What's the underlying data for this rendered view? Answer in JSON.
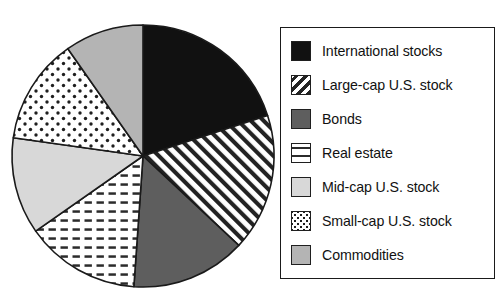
{
  "chart_data": {
    "type": "pie",
    "title": "",
    "subtitle": "",
    "xlabel": "",
    "ylabel": "",
    "legend_position": "right",
    "grid": false,
    "start_angle_deg": 0,
    "direction": "clockwise",
    "categories": [
      "International stocks",
      "Large-cap U.S. stock",
      "Bonds",
      "Real estate",
      "Mid-cap U.S. stock",
      "Small-cap U.S. stock",
      "Commodities"
    ],
    "values": [
      20,
      17,
      14,
      14,
      12,
      13,
      10
    ],
    "angles_deg": [
      72,
      61,
      51,
      51,
      43,
      47,
      35
    ],
    "slices": [
      {
        "label": "International stocks",
        "value": 20,
        "angle_deg": 72,
        "pattern": "solid-black",
        "color": "#111111"
      },
      {
        "label": "Large-cap U.S. stock",
        "value": 17,
        "angle_deg": 61,
        "pattern": "diagonal-hatch",
        "color": "#ffffff"
      },
      {
        "label": "Bonds",
        "value": 14,
        "angle_deg": 51,
        "pattern": "solid-dark-gray",
        "color": "#5e5e5e"
      },
      {
        "label": "Real estate",
        "value": 14,
        "angle_deg": 51,
        "pattern": "horizontal-dash",
        "color": "#ffffff"
      },
      {
        "label": "Mid-cap U.S. stock",
        "value": 12,
        "angle_deg": 43,
        "pattern": "solid-light-gray",
        "color": "#d8d8d8"
      },
      {
        "label": "Small-cap U.S. stock",
        "value": 13,
        "angle_deg": 47,
        "pattern": "dotted",
        "color": "#ffffff"
      },
      {
        "label": "Commodities",
        "value": 10,
        "angle_deg": 35,
        "pattern": "solid-mid-gray",
        "color": "#b4b4b4"
      }
    ]
  },
  "legend": {
    "items": [
      {
        "label": "International stocks",
        "swatch": "solid-black-swatch"
      },
      {
        "label": "Large-cap U.S. stock",
        "swatch": "diagonal-hatch-swatch"
      },
      {
        "label": "Bonds",
        "swatch": "solid-dark-gray-swatch"
      },
      {
        "label": "Real estate",
        "swatch": "horizontal-dash-swatch"
      },
      {
        "label": "Mid-cap U.S. stock",
        "swatch": "solid-light-gray-swatch"
      },
      {
        "label": "Small-cap U.S. stock",
        "swatch": "dotted-swatch"
      },
      {
        "label": "Commodities",
        "swatch": "solid-mid-gray-swatch"
      }
    ]
  },
  "colors": {
    "outline": "#1a1a1a",
    "black": "#111111",
    "dark_gray": "#5e5e5e",
    "mid_gray": "#b4b4b4",
    "light_gray": "#d8d8d8",
    "white": "#ffffff"
  }
}
